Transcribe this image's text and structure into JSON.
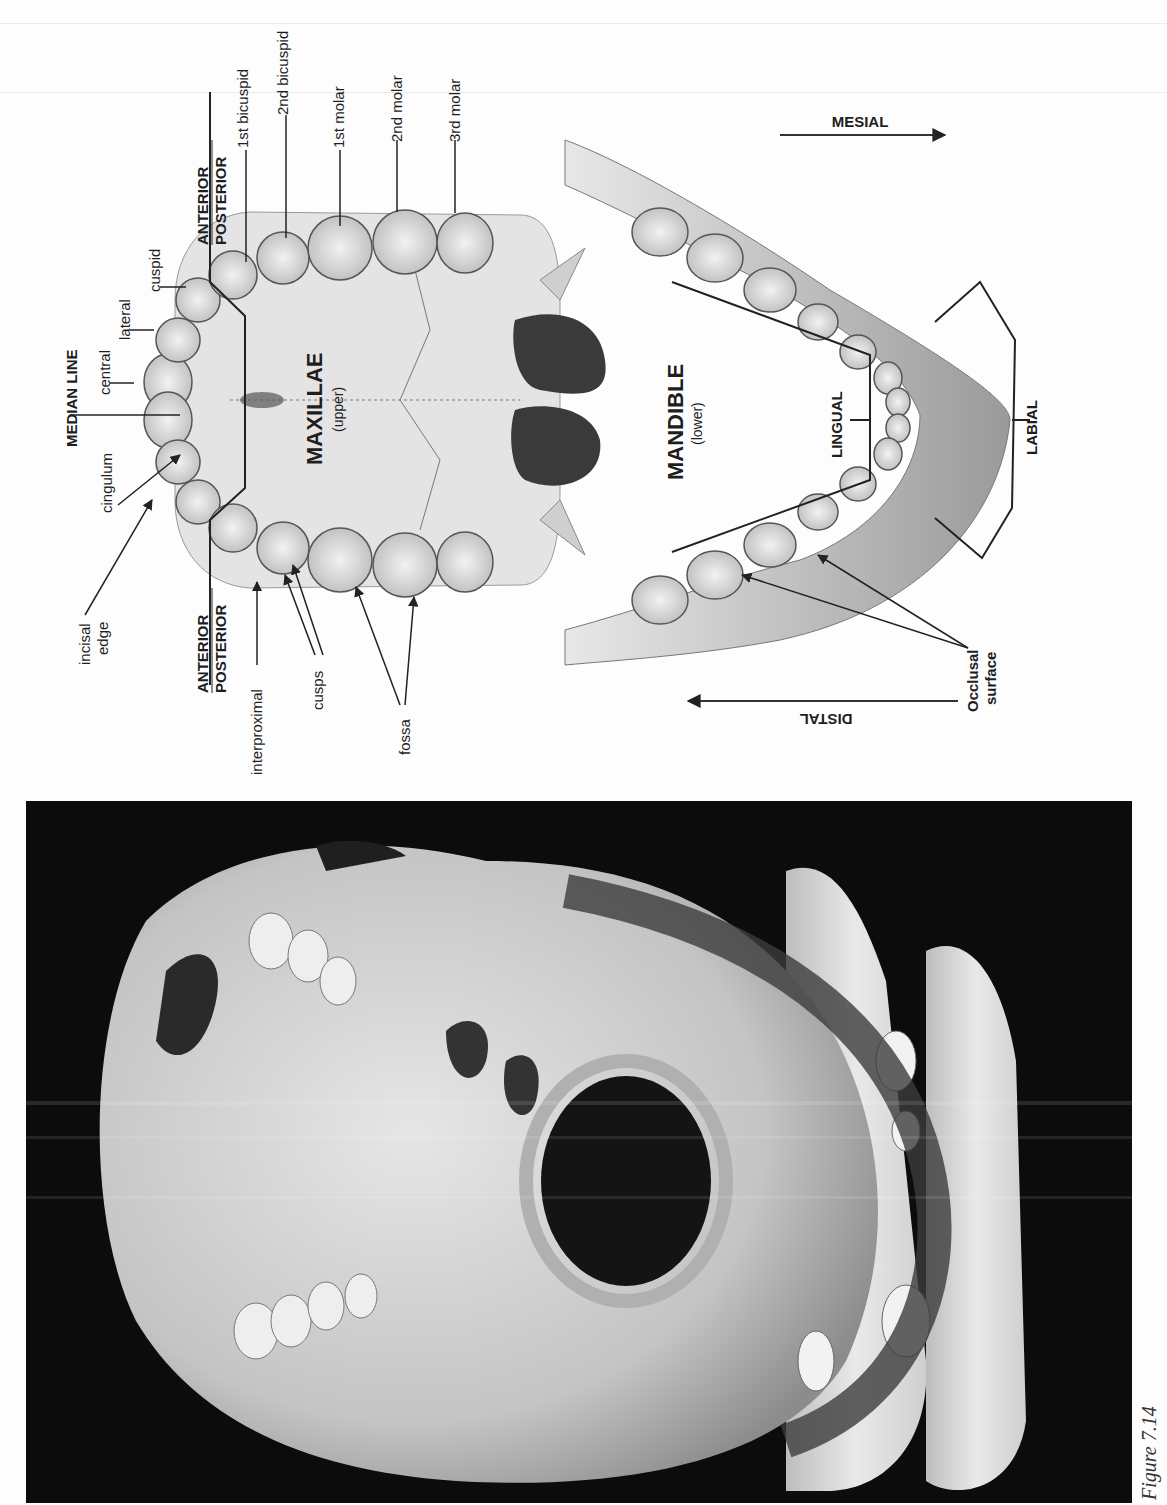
{
  "figure": {
    "caption": "Figure 7.14",
    "orientation": "rotated 90° counter-clockwise"
  },
  "diagram": {
    "maxillae": {
      "title": "MAXILLAE",
      "subtitle": "(upper)"
    },
    "mandible": {
      "title": "MANDIBLE",
      "subtitle": "(lower)"
    },
    "tooth_labels": {
      "central": "central",
      "lateral": "lateral",
      "cuspid": "cuspid",
      "first_bicuspid": "1st bicuspid",
      "second_bicuspid": "2nd bicuspid",
      "first_molar": "1st molar",
      "second_molar": "2nd molar",
      "third_molar": "3rd molar"
    },
    "feature_labels": {
      "median_line": "MEDIAN LINE",
      "cingulum": "cingulum",
      "incisal_edge_1": "incisal",
      "incisal_edge_2": "edge",
      "interproximal": "interproximal",
      "cusps": "cusps",
      "fossa": "fossa",
      "occlusal_surface_1": "Occlusal",
      "occlusal_surface_2": "surface",
      "lingual": "LINGUAL",
      "labial": "LABIAL"
    },
    "divisions": {
      "upper": {
        "anterior": "ANTERIOR",
        "posterior": "POSTERIOR"
      },
      "lower": {
        "anterior": "ANTERIOR",
        "posterior": "POSTERIOR"
      }
    },
    "directions": {
      "mesial": "MESIAL",
      "distal": "DISTAL"
    }
  },
  "photo": {
    "subject": "human skull, inferior view, held in gloved hand"
  },
  "colors": {
    "ink": "#1e1e1e",
    "paper": "#fdfdfd",
    "bone_light": "#d9d9d9",
    "photo_background": "#0c0c0c"
  }
}
